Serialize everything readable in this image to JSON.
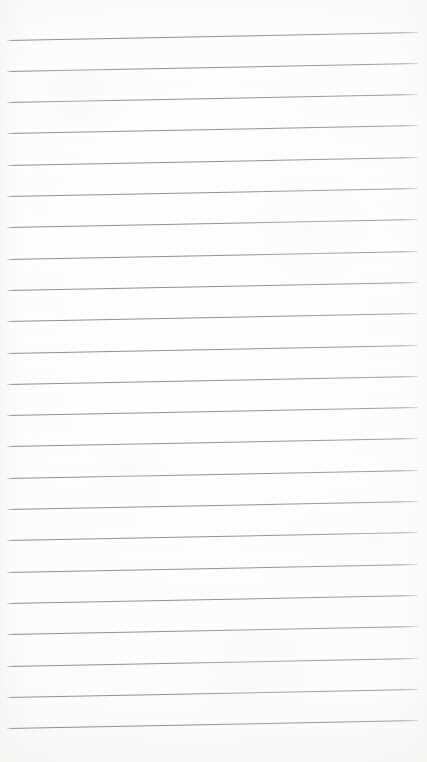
{
  "document": {
    "kind": "lined-paper-sheet",
    "title": "",
    "visible_text": "",
    "page_number": "",
    "header_text": "",
    "footer_text": ""
  },
  "paper": {
    "width_px": 427,
    "height_px": 762,
    "background_color": "#fbfbfa",
    "background_color_center": "#ffffff",
    "edge_tint_color": "#f7f7f6",
    "has_margin_rule": false,
    "has_holes": false,
    "is_blank": true
  },
  "ruling": {
    "line_color": "#929292",
    "line_thickness_px": 1,
    "line_count": 23,
    "line_spacing_px": 31.3,
    "left_inset_px": 7,
    "right_inset_px": 9,
    "tilt_degrees": -1.12,
    "first_line_y_px": 39.5,
    "last_line_y_px": 728.5,
    "line_y_positions": [
      39.5,
      70.8,
      102.1,
      133.4,
      164.7,
      196.0,
      227.3,
      258.6,
      289.9,
      321.2,
      352.5,
      383.8,
      415.1,
      446.4,
      477.7,
      509.0,
      540.3,
      571.6,
      602.9,
      634.2,
      665.5,
      696.8,
      728.1
    ]
  }
}
